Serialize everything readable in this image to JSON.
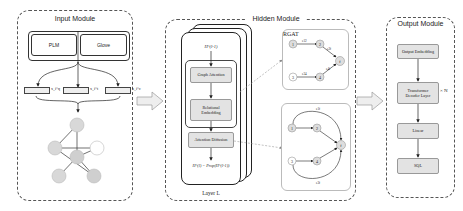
{
  "input_module": {
    "title": "Input Module",
    "encoders": [
      "PLM",
      "Glove"
    ],
    "embedding_vectors": [
      {
        "label": "x_i^q"
      },
      {
        "label": "x_i^t"
      },
      {
        "label": "x_i^c"
      }
    ],
    "graph_nodes": 6
  },
  "hidden_module": {
    "title": "Hidden Module",
    "layer_label": "Layer L",
    "input_var": "H^(l-1)",
    "steps": [
      "Graph Attention",
      "Relational Embedding",
      "Attention Diffusion"
    ],
    "output_formula": "H^(l) = Prop(H^(l-1))",
    "rgat": {
      "title": "RGAT",
      "nodes": [
        "1",
        "2",
        "3",
        "4",
        "f"
      ],
      "edges": [
        "e12",
        "e2f",
        "e34",
        "e4f"
      ]
    },
    "diffusion": {
      "nodes": [
        "1",
        "2",
        "3",
        "4",
        "f"
      ],
      "edges": [
        "e1f",
        "e3f"
      ]
    }
  },
  "output_module": {
    "title": "Output Module",
    "steps": [
      "Output Embedding",
      "Transformer Decoder Layer",
      "Linear",
      "SQL"
    ],
    "repeat_label": "× N"
  }
}
